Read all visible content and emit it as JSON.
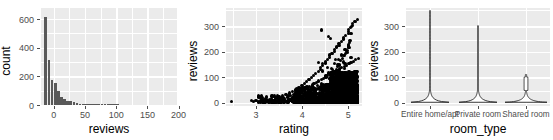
{
  "figure": {
    "panel_background": "#ebebeb",
    "grid_color": "#ffffff",
    "bar_color": "#595959",
    "point_color": "#000000",
    "text_color": "#4d4d4d",
    "title_color": "#000000"
  },
  "chart_data": [
    {
      "type": "bar",
      "title": "",
      "xlabel": "reviews",
      "ylabel": "count",
      "xlim": [
        -8,
        210
      ],
      "ylim": [
        0,
        640
      ],
      "xticks": [
        0,
        50,
        100,
        150,
        200
      ],
      "xtick_labels": [
        "0",
        "50",
        "100",
        "150",
        "200"
      ],
      "yticks": [
        0,
        200,
        400,
        600
      ],
      "ytick_labels": [
        "0",
        "200",
        "400",
        "600"
      ],
      "grid": true,
      "legend": "none",
      "bin_width": 5,
      "categories": [
        "0",
        "5",
        "10",
        "15",
        "20",
        "25",
        "30",
        "35",
        "40",
        "45",
        "50",
        "55",
        "60",
        "65",
        "70",
        "75",
        "80",
        "85",
        "90",
        "95",
        "100",
        "105",
        "110",
        "115",
        "120",
        "125",
        "130",
        "135",
        "140",
        "145",
        "150",
        "155",
        "160",
        "165",
        "170",
        "175",
        "180",
        "185",
        "190",
        "195",
        "200"
      ],
      "values": [
        615,
        315,
        178,
        152,
        96,
        54,
        46,
        30,
        26,
        19,
        12,
        11,
        10,
        9,
        6,
        5,
        4,
        4,
        3,
        3,
        2,
        1,
        1,
        1,
        0,
        0,
        0,
        0,
        0,
        0,
        0,
        0,
        0,
        0,
        0,
        0,
        0,
        0,
        0,
        0,
        0
      ]
    },
    {
      "type": "scatter",
      "title": "",
      "xlabel": "rating",
      "ylabel": "reviews",
      "xlim": [
        2.35,
        5.3
      ],
      "ylim": [
        -14,
        355
      ],
      "xticks": [
        3,
        4,
        5
      ],
      "xtick_labels": [
        "3",
        "4",
        "5"
      ],
      "yticks": [
        0,
        100,
        200,
        300
      ],
      "ytick_labels": [
        "0",
        "100",
        "200",
        "300"
      ],
      "grid": true,
      "legend": "none",
      "point_size": 1.6,
      "description": "Dense black cloud concentrated at ratings 4.5-5.1 with reviews mostly under 60; a sparse upward-fanning tail reaches ~340 reviews near rating 5.0.",
      "x": [
        2.47,
        2.9,
        2.95,
        3.0,
        3.12,
        3.2,
        3.25,
        3.3,
        3.34,
        3.38,
        3.42,
        3.45,
        3.48,
        3.5,
        3.52,
        3.55,
        3.58,
        3.6,
        3.62,
        3.65,
        3.68,
        3.7,
        3.72,
        3.75,
        3.78,
        3.8,
        3.82,
        3.85,
        3.88,
        3.9,
        3.92,
        3.95,
        3.98,
        4.0,
        4.0,
        4.02,
        4.04,
        4.05,
        4.06,
        4.08,
        4.1,
        4.1,
        4.12,
        4.14,
        4.15,
        4.16,
        4.18,
        4.2,
        4.2,
        4.22,
        4.24,
        4.25,
        4.26,
        4.28,
        4.3,
        4.3,
        4.32,
        4.34,
        4.35,
        4.36,
        4.38,
        4.4,
        4.4,
        4.4,
        4.42,
        4.44,
        4.45,
        4.46,
        4.48,
        4.5,
        4.5,
        4.5,
        4.52,
        4.54,
        4.55,
        4.56,
        4.58,
        4.6,
        4.6,
        4.6,
        4.62,
        4.64,
        4.65,
        4.66,
        4.68,
        4.7,
        4.7,
        4.7,
        4.72,
        4.74,
        4.75,
        4.76,
        4.78,
        4.8,
        4.8,
        4.8,
        4.82,
        4.84,
        4.85,
        4.86,
        4.88,
        4.9,
        4.9,
        4.9,
        4.92,
        4.94,
        4.95,
        4.96,
        4.98,
        5.0,
        5.0,
        5.0,
        5.0,
        5.02,
        5.04,
        5.05,
        5.06,
        5.08,
        5.1,
        5.1,
        5.1,
        5.12,
        5.14,
        5.15,
        5.16,
        5.18,
        5.2,
        5.2,
        5.22,
        4.35,
        4.45,
        4.55,
        4.65,
        4.72,
        4.78,
        4.85,
        4.92,
        4.97,
        5.02,
        5.07,
        4.88,
        4.93,
        4.98,
        5.03,
        4.62,
        4.68,
        4.74,
        4.82,
        4.9,
        4.95,
        5.0,
        5.05,
        4.45,
        4.52,
        4.6,
        4.7,
        4.76,
        4.84,
        4.91,
        4.99,
        5.04,
        4.58,
        4.66,
        4.73,
        4.81,
        4.87,
        4.94,
        5.01,
        5.06,
        4.42,
        4.5,
        4.57,
        4.64,
        4.71,
        4.79,
        4.86,
        4.93,
        5.0,
        5.08
      ],
      "y": [
        4,
        6,
        3,
        8,
        5,
        12,
        7,
        9,
        15,
        6,
        11,
        18,
        8,
        22,
        14,
        9,
        25,
        16,
        12,
        30,
        20,
        10,
        35,
        24,
        15,
        42,
        28,
        18,
        50,
        32,
        20,
        55,
        38,
        8,
        62,
        45,
        26,
        70,
        50,
        30,
        12,
        78,
        55,
        35,
        85,
        60,
        40,
        15,
        92,
        65,
        45,
        100,
        70,
        48,
        18,
        108,
        75,
        52,
        115,
        80,
        55,
        20,
        122,
        130,
        85,
        58,
        140,
        90,
        62,
        22,
        148,
        155,
        95,
        65,
        162,
        100,
        68,
        25,
        170,
        178,
        105,
        70,
        185,
        110,
        72,
        28,
        192,
        200,
        115,
        75,
        208,
        120,
        78,
        30,
        215,
        222,
        125,
        80,
        230,
        130,
        82,
        32,
        238,
        245,
        135,
        85,
        252,
        140,
        88,
        35,
        260,
        268,
        275,
        145,
        90,
        282,
        150,
        92,
        38,
        290,
        298,
        155,
        95,
        305,
        160,
        98,
        40,
        312,
        165,
        150,
        118,
        132,
        96,
        160,
        142,
        175,
        128,
        190,
        205,
        168,
        112,
        145,
        188,
        225,
        240,
        108,
        124,
        138,
        152,
        198,
        212,
        168,
        145,
        102,
        88,
        116,
        134,
        158,
        176,
        194,
        232,
        248,
        122,
        104,
        142,
        166,
        184,
        206,
        258,
        272,
        96,
        110,
        128,
        146,
        162,
        180,
        198,
        216,
        286,
        340
      ]
    },
    {
      "type": "violin",
      "title": "",
      "xlabel": "room_type",
      "ylabel": "reviews",
      "ylim": [
        -14,
        355
      ],
      "yticks": [
        0,
        100,
        200,
        300
      ],
      "ytick_labels": [
        "0",
        "100",
        "200",
        "300"
      ],
      "grid": true,
      "legend": "none",
      "categories": [
        "Entire home/apt",
        "Private room",
        "Shared room"
      ],
      "max_values": [
        345,
        288,
        104
      ],
      "description": "Three violins, each a narrow vertical spike with a wide flared base near zero reviews; Entire home/apt reaches ~345, Private room ~288, Shared room ~104."
    }
  ]
}
